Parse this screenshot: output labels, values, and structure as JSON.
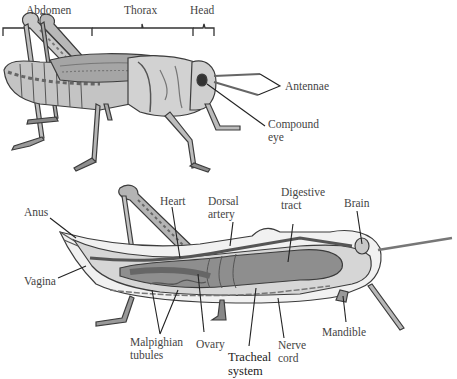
{
  "diagram": {
    "external_view": {
      "body_regions": [
        {
          "label": "Abdomen"
        },
        {
          "label": "Thorax"
        },
        {
          "label": "Head"
        }
      ],
      "labels": {
        "antennae": "Antennae",
        "compound_eye_line1": "Compound",
        "compound_eye_line2": "eye"
      }
    },
    "internal_view": {
      "labels": {
        "anus": "Anus",
        "vagina": "Vagina",
        "heart": "Heart",
        "dorsal_artery_line1": "Dorsal",
        "dorsal_artery_line2": "artery",
        "digestive_tract_line1": "Digestive",
        "digestive_tract_line2": "tract",
        "brain": "Brain",
        "malpighian_line1": "Malpighian",
        "malpighian_line2": "tubules",
        "ovary": "Ovary",
        "tracheal_line1": "Tracheal",
        "tracheal_line2": "system",
        "nerve_cord_line1": "Nerve",
        "nerve_cord_line2": "cord",
        "mandible": "Mandible"
      }
    },
    "colors": {
      "body_light": "#d9d9d9",
      "body_mid": "#a8a8a8",
      "body_dark": "#6a6a6a",
      "outline": "#3c3c3c",
      "leader_line": "#222222"
    }
  }
}
